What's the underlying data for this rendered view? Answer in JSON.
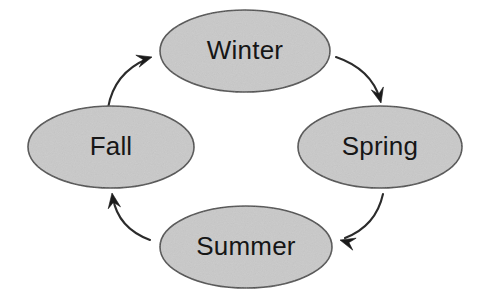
{
  "diagram": {
    "type": "cycle-diagram",
    "background_color": "#ffffff",
    "node_fill_color": "#c9c9c9",
    "node_stroke_color": "#4d4d4d",
    "arrow_color": "#1b1b1b",
    "label_color": "#161616",
    "nodes": [
      {
        "id": "winter",
        "label": "Winter",
        "cx": 245,
        "cy": 51,
        "rx": 85,
        "ry": 41
      },
      {
        "id": "spring",
        "label": "Spring",
        "cx": 380,
        "cy": 147,
        "rx": 82,
        "ry": 41
      },
      {
        "id": "summer",
        "label": "Summer",
        "cx": 246,
        "cy": 247,
        "rx": 86,
        "ry": 41
      },
      {
        "id": "fall",
        "label": "Fall",
        "cx": 111,
        "cy": 147,
        "rx": 83,
        "ry": 41
      }
    ],
    "arrows": [
      {
        "id": "winter-to-spring",
        "from": "winter",
        "to": "spring",
        "path": "M 336 57 Q 371 69 380 99",
        "head_x": 381,
        "head_y": 103,
        "head_angle": 76
      },
      {
        "id": "spring-to-summer",
        "from": "spring",
        "to": "summer",
        "path": "M 383 194 Q 376 226 345 238",
        "head_x": 340,
        "head_y": 240,
        "head_angle": 196
      },
      {
        "id": "summer-to-fall",
        "from": "summer",
        "to": "fall",
        "path": "M 150 240 Q 118 228 113 198",
        "head_x": 112,
        "head_y": 193,
        "head_angle": 261
      },
      {
        "id": "fall-to-winter",
        "from": "fall",
        "to": "winter",
        "path": "M 108 108 Q 114 73 147 59",
        "head_x": 152,
        "head_y": 57,
        "head_angle": 344
      }
    ]
  }
}
